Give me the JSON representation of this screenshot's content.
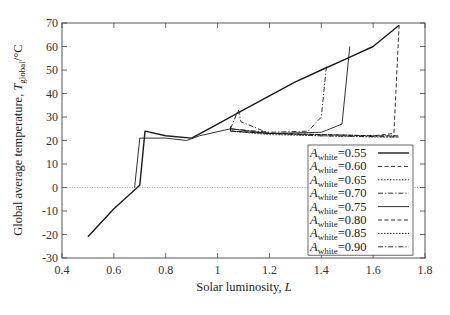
{
  "chart_data": {
    "type": "line",
    "title": "",
    "xlabel": "Solar luminosity, L",
    "ylabel": "Global average temperature, T_global/°C",
    "xlim": [
      0.4,
      1.8
    ],
    "ylim": [
      -30,
      70
    ],
    "x_ticks": [
      0.4,
      0.6,
      0.8,
      1.0,
      1.2,
      1.4,
      1.6,
      1.8
    ],
    "x_tick_labels": [
      "0.4",
      "0.6",
      "0.8",
      "1",
      "1.2",
      "1.4",
      "1.6",
      "1.8"
    ],
    "y_ticks": [
      -30,
      -20,
      -10,
      0,
      10,
      20,
      30,
      40,
      50,
      60,
      70
    ],
    "y_tick_labels": [
      "-30",
      "-20",
      "-10",
      "0",
      "10",
      "20",
      "30",
      "40",
      "50",
      "60",
      "70"
    ],
    "reference_line": {
      "y": 0,
      "style": "dotted"
    },
    "grid": false,
    "legend_position": "lower right",
    "series": [
      {
        "name": "A_white=0.55",
        "style": "solid",
        "width": 1.4,
        "points": [
          [
            0.5,
            -21
          ],
          [
            0.6,
            -9
          ],
          [
            0.7,
            1
          ],
          [
            0.72,
            24
          ],
          [
            0.8,
            22
          ],
          [
            0.9,
            21
          ],
          [
            1.0,
            27
          ],
          [
            1.1,
            33
          ],
          [
            1.2,
            39
          ],
          [
            1.3,
            45
          ],
          [
            1.4,
            50
          ],
          [
            1.5,
            55
          ],
          [
            1.6,
            60
          ],
          [
            1.7,
            69
          ]
        ]
      },
      {
        "name": "A_white=0.60",
        "style": "dashed",
        "width": 0.9,
        "points": [
          [
            1.05,
            26
          ],
          [
            1.05,
            24
          ],
          [
            1.2,
            23
          ],
          [
            1.4,
            22.5
          ],
          [
            1.6,
            22
          ],
          [
            1.68,
            23
          ],
          [
            1.7,
            69
          ]
        ]
      },
      {
        "name": "A_white=0.65",
        "style": "dotted",
        "width": 0.9,
        "points": [
          [
            1.05,
            26
          ],
          [
            1.05,
            24
          ],
          [
            1.2,
            23
          ],
          [
            1.4,
            22.5
          ],
          [
            1.6,
            22
          ],
          [
            1.7,
            22
          ]
        ]
      },
      {
        "name": "A_white=0.70",
        "style": "dashdot",
        "width": 0.9,
        "points": [
          [
            1.05,
            25
          ],
          [
            1.2,
            23.5
          ],
          [
            1.35,
            24
          ],
          [
            1.4,
            30
          ],
          [
            1.42,
            52
          ]
        ]
      },
      {
        "name": "A_white=0.75",
        "style": "solid",
        "width": 0.9,
        "points": [
          [
            0.68,
            0
          ],
          [
            0.7,
            21
          ],
          [
            0.8,
            21
          ],
          [
            0.88,
            20
          ],
          [
            0.93,
            22
          ],
          [
            1.05,
            25
          ],
          [
            1.2,
            23
          ],
          [
            1.4,
            23.5
          ],
          [
            1.48,
            27
          ],
          [
            1.51,
            60
          ]
        ]
      },
      {
        "name": "A_white=0.80",
        "style": "dashed",
        "width": 0.9,
        "points": [
          [
            1.05,
            24
          ],
          [
            1.2,
            23
          ],
          [
            1.4,
            22.5
          ],
          [
            1.6,
            22
          ],
          [
            1.7,
            22
          ]
        ]
      },
      {
        "name": "A_white=0.85",
        "style": "dotted",
        "width": 0.9,
        "points": [
          [
            1.05,
            24
          ],
          [
            1.2,
            22.5
          ],
          [
            1.4,
            22
          ],
          [
            1.6,
            21.5
          ],
          [
            1.7,
            21.5
          ]
        ]
      },
      {
        "name": "A_white=0.90",
        "style": "dashdot",
        "width": 0.9,
        "points": [
          [
            1.05,
            25
          ],
          [
            1.08,
            33
          ],
          [
            1.09,
            28
          ],
          [
            1.2,
            23
          ],
          [
            1.4,
            22
          ],
          [
            1.7,
            21.5
          ]
        ]
      }
    ]
  },
  "legend": {
    "entries": [
      {
        "base": "A",
        "sub": "white",
        "value": "=0.55"
      },
      {
        "base": "A",
        "sub": "white",
        "value": "=0.60"
      },
      {
        "base": "A",
        "sub": "white",
        "value": "=0.65"
      },
      {
        "base": "A",
        "sub": "white",
        "value": "=0.70"
      },
      {
        "base": "A",
        "sub": "white",
        "value": "=0.75"
      },
      {
        "base": "A",
        "sub": "white",
        "value": "=0.80"
      },
      {
        "base": "A",
        "sub": "white",
        "value": "=0.85"
      },
      {
        "base": "A",
        "sub": "white",
        "value": "=0.90"
      }
    ]
  },
  "axes": {
    "xlabel_main": "Solar luminosity, ",
    "xlabel_var": "L",
    "ylabel_main": "Global average temperature, ",
    "ylabel_var": "T",
    "ylabel_sub": "global",
    "ylabel_unit": "/°C"
  },
  "colors": {
    "line": "#1a1a1a",
    "axis": "#444444",
    "zero_line": "#999999"
  }
}
